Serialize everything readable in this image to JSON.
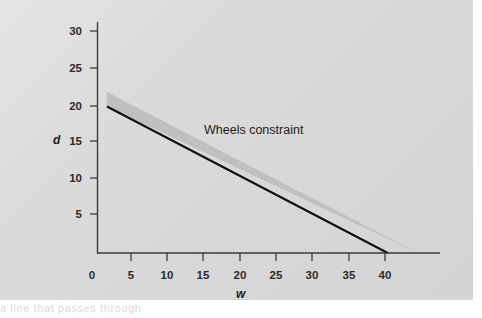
{
  "figure": {
    "plate_color": "#d8d8d8",
    "page_color": "#ffffff",
    "axis_color": "#333333",
    "line_color": "#111111",
    "band_color": "#c0c0c0",
    "caption_ghost": "                    a line  that      passes  through"
  },
  "chart_data": {
    "type": "line",
    "title": "",
    "xlabel": "w",
    "ylabel": "d",
    "xlim": [
      0,
      45.5
    ],
    "ylim": [
      0,
      31.5
    ],
    "grid": false,
    "legend": "none",
    "xticks": [
      0,
      5,
      10,
      15,
      20,
      25,
      30,
      35,
      40
    ],
    "xtick_labels": [
      "0",
      "5",
      "10",
      "15",
      "20",
      "25",
      "30",
      "35",
      "40"
    ],
    "yticks": [
      5,
      10,
      15,
      20,
      25,
      30
    ],
    "ytick_labels": [
      "5",
      "10",
      "15",
      "20",
      "25",
      "30"
    ],
    "series": [
      {
        "name": "Wheels constraint",
        "kind": "line",
        "x": [
          1.3,
          40.0
        ],
        "y": [
          20.0,
          0.0
        ],
        "slope": -0.517,
        "intercept": 20.67,
        "color": "#111111",
        "width_px": 2.2
      },
      {
        "name": "Wheels constraint band",
        "kind": "band",
        "x": [
          1.3,
          44.2
        ],
        "y_upper": [
          22.0,
          0.0
        ],
        "y_lower": [
          20.0,
          0.0
        ],
        "color": "#c0c0c0"
      }
    ],
    "annotations": [
      {
        "text": "Wheels constraint",
        "x": 21.5,
        "y": 16.6
      }
    ]
  }
}
